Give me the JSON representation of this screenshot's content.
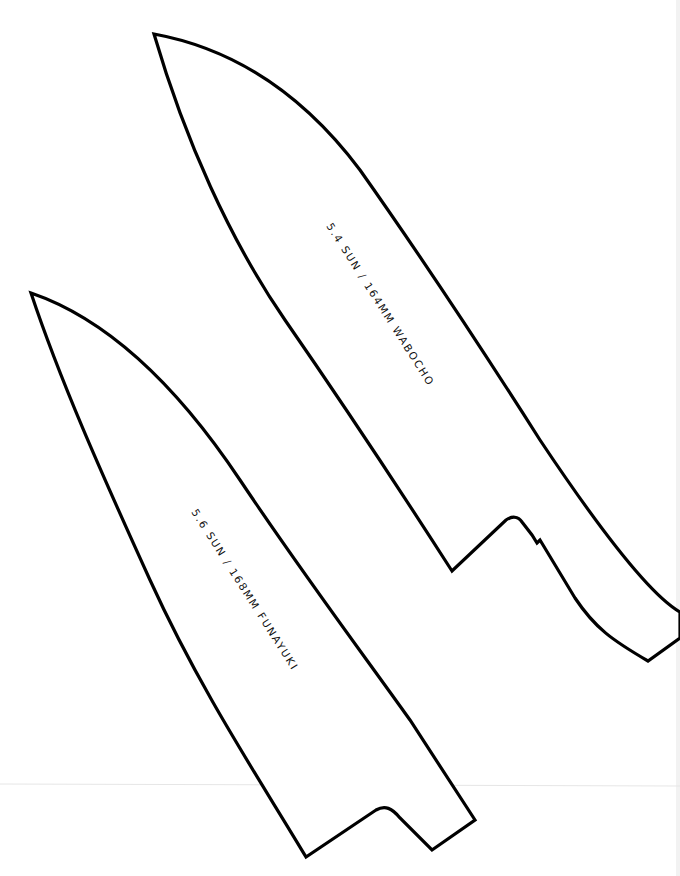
{
  "diagram": {
    "type": "knife-templates",
    "background": "#ffffff",
    "stroke_color": "#000000",
    "knives": [
      {
        "id": "wabocho",
        "label": "5.4 SUN / 164MM WABOCHO",
        "length_sun": "5.4",
        "length_mm": "164"
      },
      {
        "id": "funayuki",
        "label": "5.6 SUN / 168MM FUNAYUKI",
        "length_sun": "5.6",
        "length_mm": "168"
      }
    ]
  }
}
